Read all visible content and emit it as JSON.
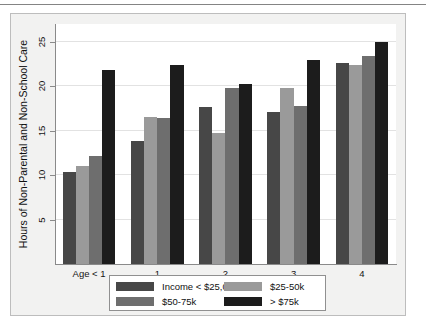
{
  "chart_data": {
    "type": "bar",
    "title": "",
    "xlabel": "",
    "ylabel": "Hours of Non-Parental and Non-School Care",
    "categories": [
      "Age < 1",
      "1",
      "2",
      "3",
      "4"
    ],
    "ylim": [
      0,
      27
    ],
    "yticks": [
      5,
      10,
      15,
      20,
      25
    ],
    "grid": true,
    "legend_position": "bottom",
    "series": [
      {
        "name": "Income < $25,000",
        "color": "#474747",
        "values": [
          10.4,
          13.8,
          17.7,
          17.1,
          22.6
        ]
      },
      {
        "name": "$25-50k",
        "color": "#9a9a9a",
        "values": [
          11.0,
          16.5,
          14.7,
          19.8,
          22.4
        ]
      },
      {
        "name": "$50-75k",
        "color": "#6e6e6e",
        "values": [
          12.2,
          16.4,
          19.8,
          17.8,
          23.4
        ]
      },
      {
        "name": "> $75k",
        "color": "#1c1c1c",
        "values": [
          21.8,
          22.4,
          20.3,
          23.0,
          25.0
        ]
      }
    ]
  },
  "axes": {
    "y_tick_labels": [
      "5",
      "10",
      "15",
      "20",
      "25"
    ],
    "x_tick_labels": [
      "Age < 1",
      "1",
      "2",
      "3",
      "4"
    ]
  },
  "legend": {
    "entries": [
      {
        "label": "Income < $25,000",
        "color": "#474747"
      },
      {
        "label": "$25-50k",
        "color": "#9a9a9a"
      },
      {
        "label": "$50-75k",
        "color": "#6e6e6e"
      },
      {
        "label": "> $75k",
        "color": "#1c1c1c"
      }
    ]
  }
}
